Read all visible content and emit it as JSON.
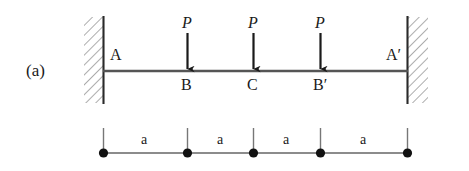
{
  "figure": {
    "label": "(a)",
    "type": "fixed-fixed-beam-with-three-point-loads"
  },
  "supports": {
    "left": {
      "name": "A",
      "label": "A",
      "kind": "fixed-wall"
    },
    "right": {
      "name": "A-prime",
      "label": "A′",
      "kind": "fixed-wall"
    }
  },
  "beam": {
    "nodes": [
      {
        "id": "A",
        "label": "A"
      },
      {
        "id": "B",
        "label": "B"
      },
      {
        "id": "C",
        "label": "C"
      },
      {
        "id": "Bp",
        "label": "B′"
      },
      {
        "id": "Ap",
        "label": "A′"
      }
    ]
  },
  "loads": [
    {
      "at": "B",
      "label": "P",
      "direction": "down"
    },
    {
      "at": "C",
      "label": "P",
      "direction": "down"
    },
    {
      "at": "Bp",
      "label": "P",
      "direction": "down"
    }
  ],
  "dimensions": {
    "segments": [
      {
        "label": "a",
        "from": "A",
        "to": "B"
      },
      {
        "label": "a",
        "from": "B",
        "to": "C"
      },
      {
        "label": "a",
        "from": "C",
        "to": "B′"
      },
      {
        "label": "a",
        "from": "B′",
        "to": "A′"
      }
    ]
  },
  "colors": {
    "ink": "#1a1a1a",
    "line": "#4a4a4a",
    "hatch": "#8a8a8a",
    "background": "#ffffff"
  }
}
